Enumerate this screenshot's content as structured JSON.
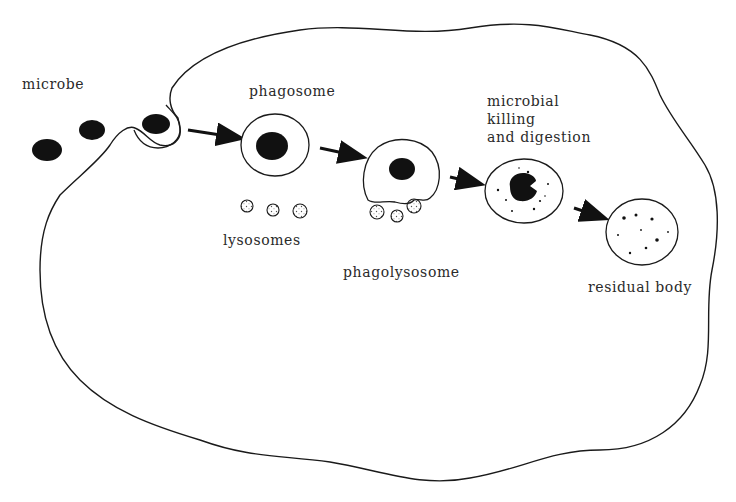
{
  "diagram": {
    "labels": {
      "microbe": "microbe",
      "phagosome": "phagosome",
      "lysosomes": "lysosomes",
      "phagolysosome": "phagolysosome",
      "killing_line1": "microbial",
      "killing_line2": "killing",
      "killing_line3": "and digestion",
      "residual_body": "residual body"
    },
    "colors": {
      "stroke": "#1a1a1a",
      "fill": "#111111",
      "background": "#ffffff",
      "text": "#2a2a2a"
    }
  }
}
